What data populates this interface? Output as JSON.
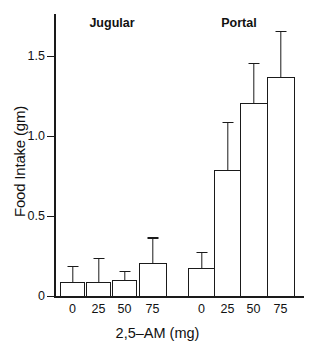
{
  "chart_data": {
    "type": "bar",
    "title": "",
    "xlabel": "2,5–AM (mg)",
    "ylabel": "Food Intake (gm)",
    "ylim": [
      0,
      1.75
    ],
    "yticks": [
      0,
      0.5,
      1.0,
      1.5
    ],
    "ytick_labels": [
      "0",
      "0.5",
      "1.0",
      "1.5"
    ],
    "grid": false,
    "legend": "none",
    "group_labels": [
      "Jugular",
      "Portal"
    ],
    "categories": [
      "0",
      "25",
      "50",
      "75"
    ],
    "groups": [
      {
        "name": "Jugular",
        "categories": [
          "0",
          "25",
          "50",
          "75"
        ],
        "values": [
          0.09,
          0.09,
          0.1,
          0.21
        ],
        "errors_upper": [
          0.19,
          0.24,
          0.16,
          0.37
        ]
      },
      {
        "name": "Portal",
        "categories": [
          "0",
          "25",
          "50",
          "75"
        ],
        "values": [
          0.18,
          0.79,
          1.21,
          1.37
        ],
        "errors_upper": [
          0.28,
          1.09,
          1.46,
          1.66
        ]
      }
    ],
    "colors": {
      "bar_fill": "#ffffff",
      "bar_edge": "#1a1a1a",
      "axis": "#1a1a1a",
      "text": "#111111"
    }
  }
}
